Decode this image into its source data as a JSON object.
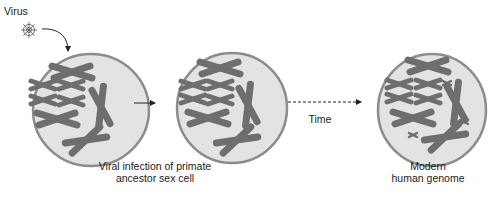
{
  "diagram": {
    "virus_label": "Virus",
    "time_label": "Time",
    "cell_infection_label_line1": "Viral infection of primate",
    "cell_infection_label_line2": "ancestor sex cell",
    "modern_label_line1": "Modern",
    "modern_label_line2": "human genome",
    "colors": {
      "cell_fill": "#e3e3e3",
      "cell_border": "#8c8c8c",
      "chromosome": "#6e6e6e",
      "arrow": "#222222"
    },
    "stages": [
      {
        "name": "infected-cell"
      },
      {
        "name": "post-infection-cell"
      },
      {
        "name": "modern-genome-cell"
      }
    ]
  }
}
